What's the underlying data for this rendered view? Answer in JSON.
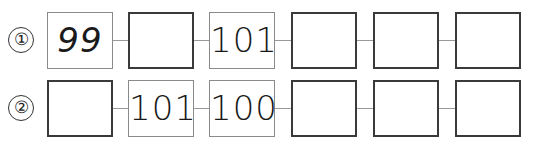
{
  "problems": [
    {
      "label": "①",
      "cells": [
        {
          "value": "99",
          "type": "given"
        },
        {
          "value": "",
          "type": "blank"
        },
        {
          "value": "101",
          "type": "given"
        },
        {
          "value": "",
          "type": "blank"
        },
        {
          "value": "",
          "type": "blank"
        },
        {
          "value": "",
          "type": "blank"
        }
      ]
    },
    {
      "label": "②",
      "cells": [
        {
          "value": "",
          "type": "blank"
        },
        {
          "value": "101",
          "type": "given"
        },
        {
          "value": "100",
          "type": "given"
        },
        {
          "value": "",
          "type": "blank"
        },
        {
          "value": "",
          "type": "blank"
        },
        {
          "value": "",
          "type": "blank"
        }
      ]
    }
  ]
}
